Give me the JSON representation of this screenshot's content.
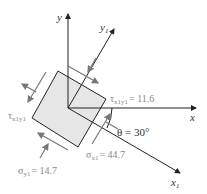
{
  "diagram": {
    "axes": {
      "x": "x",
      "y": "y",
      "x1": "x",
      "x1_sub": "1",
      "y1": "y",
      "y1_sub": "1"
    },
    "labels": {
      "tau_main": "τ",
      "tau_sub": "x1y1",
      "tau_value": "= 11.6",
      "tau_left": "τ",
      "tau_left_sub": "x1y1",
      "sigma_x1": "σ",
      "sigma_x1_sub": "x1",
      "sigma_x1_value": "= 44.7",
      "sigma_y1": "σ",
      "sigma_y1_sub": "y1",
      "sigma_y1_value": "= 14.7",
      "theta": "θ = 30°"
    },
    "colors": {
      "element_fill": "#e6e6e6",
      "line": "#222222",
      "stress_arrow": "#777777",
      "label_gray": "#888888"
    }
  }
}
